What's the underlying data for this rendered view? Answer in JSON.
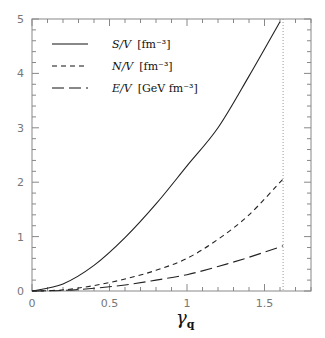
{
  "chart_data": {
    "type": "line",
    "title": "",
    "xlabel": "γ_q",
    "ylabel": "",
    "xlim": [
      0,
      1.8
    ],
    "ylim": [
      0,
      5
    ],
    "xticks": [
      "0",
      "0.5",
      "1",
      "1.5"
    ],
    "yticks": [
      "0",
      "1",
      "2",
      "3",
      "4",
      "5"
    ],
    "legend_position": "upper-left",
    "vertical_marker": 1.62,
    "series": [
      {
        "name": "S/V [fm⁻³]",
        "style": "solid",
        "x": [
          0,
          0.2,
          0.4,
          0.6,
          0.8,
          1.0,
          1.2,
          1.4,
          1.6
        ],
        "values": [
          0,
          0.13,
          0.47,
          0.98,
          1.6,
          2.3,
          3.0,
          3.95,
          4.95
        ]
      },
      {
        "name": "N/V [fm⁻³]",
        "style": "dashed",
        "x": [
          0,
          0.2,
          0.4,
          0.6,
          0.8,
          1.0,
          1.2,
          1.4,
          1.62
        ],
        "values": [
          0,
          0.02,
          0.1,
          0.22,
          0.38,
          0.6,
          0.95,
          1.4,
          2.06
        ]
      },
      {
        "name": "E/V [GeV fm⁻³]",
        "style": "long-dashed",
        "x": [
          0,
          0.2,
          0.4,
          0.6,
          0.8,
          1.0,
          1.2,
          1.4,
          1.62
        ],
        "values": [
          0,
          0.01,
          0.05,
          0.11,
          0.2,
          0.3,
          0.45,
          0.62,
          0.83
        ]
      }
    ]
  },
  "legend": {
    "s": {
      "var": "S/V",
      "unit": "[fm⁻³]"
    },
    "n": {
      "var": "N/V",
      "unit": "[fm⁻³]"
    },
    "e": {
      "var": "E/V",
      "unit": "[GeV fm⁻³]"
    }
  },
  "axis": {
    "xlabel_main": "γ",
    "xlabel_sub": "q"
  }
}
